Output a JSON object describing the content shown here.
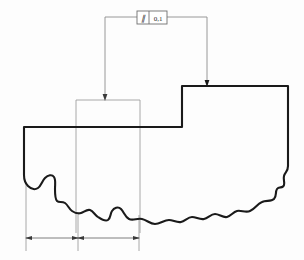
{
  "drawing": {
    "title": "Parallelism GD&T Section View",
    "background_color": "#fdfdfd",
    "outline_color": "#1a1a1a",
    "thin_line_color": "#9a9a9a",
    "leader_color": "#8c8c8c",
    "annotation_color": "#2a2a2a"
  },
  "feature_control_frame": {
    "name": "parallelism-callout",
    "symbol": "∥",
    "symbol_label": "parallelism-symbol",
    "tolerance_value": "0,1",
    "box": {
      "x": 137,
      "y": 11,
      "width": 30,
      "height": 13
    },
    "divider_x": 149
  },
  "leaders": [
    {
      "name": "leader-left",
      "target": "thin-rectangle-top-edge",
      "terminator": "arrow",
      "path": "M 139,17 L 105,17 L 105,100",
      "arrow_x": 105,
      "arrow_y": 100
    },
    {
      "name": "leader-right",
      "target": "step-top-edge",
      "terminator": "dot",
      "path": "M 165,17 L 207,17 L 207,86",
      "arrow_x": 207,
      "arrow_y": 86
    }
  ],
  "profile": {
    "name": "part-section-outline",
    "top_left": {
      "x": 24,
      "y": 127
    },
    "ledge_right": {
      "x": 182,
      "y": 127
    },
    "step_top_left": {
      "x": 182,
      "y": 86
    },
    "top_right": {
      "x": 288,
      "y": 86
    },
    "right_bottom_y": 186,
    "left_bottom_y": 180,
    "break_line_label": "wavy-break-line"
  },
  "thin_rectangle": {
    "name": "projection-rectangle",
    "x": 76,
    "y": 100,
    "width": 64,
    "height": 133
  },
  "dimensions": [
    {
      "name": "dimension-left",
      "from_x": 26,
      "to_x": 78,
      "y": 238,
      "value": ""
    },
    {
      "name": "dimension-right",
      "from_x": 78,
      "to_x": 139,
      "y": 238,
      "value": ""
    }
  ],
  "extension_lines": [
    {
      "name": "extension-line-1",
      "x": 26,
      "y1": 180,
      "y2": 250
    },
    {
      "name": "extension-line-2",
      "x": 78,
      "y1": 100,
      "y2": 250
    },
    {
      "name": "extension-line-3",
      "x": 139,
      "y1": 100,
      "y2": 250
    }
  ]
}
